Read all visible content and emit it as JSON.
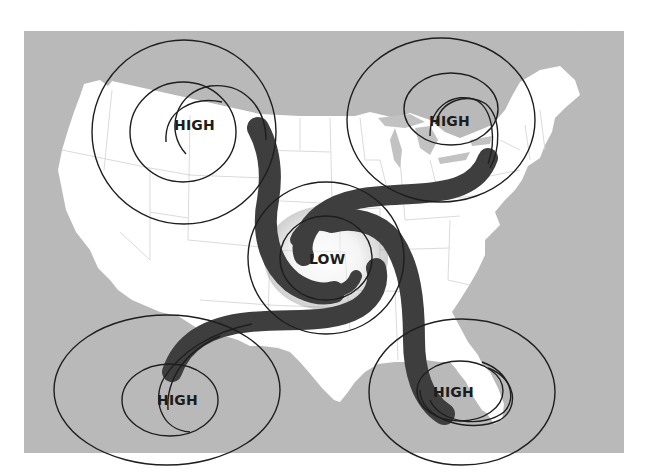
{
  "figure": {
    "colors": {
      "page_background": "#ffffff",
      "ocean_and_neighbors": "#b9b9b9",
      "land": "#ffffff",
      "state_borders": "#d4d4d4",
      "isobar_lines": "#1e1e1e",
      "airflow_bands": "#3e3e3e",
      "label_text": "#1c1c1c"
    }
  },
  "pressure_systems": [
    {
      "id": "high-northwest",
      "label": "HIGH",
      "type": "high",
      "region": "Northwest (Montana/Idaho)"
    },
    {
      "id": "high-northeast",
      "label": "HIGH",
      "type": "high",
      "region": "Great Lakes / Ontario"
    },
    {
      "id": "high-southwest",
      "label": "HIGH",
      "type": "high",
      "region": "Southwest / Mexico border"
    },
    {
      "id": "high-southeast",
      "label": "HIGH",
      "type": "high",
      "region": "Gulf of Mexico / Florida"
    },
    {
      "id": "low-center",
      "label": "LOW",
      "type": "low",
      "region": "Central Plains (Kansas/Oklahoma)"
    }
  ]
}
